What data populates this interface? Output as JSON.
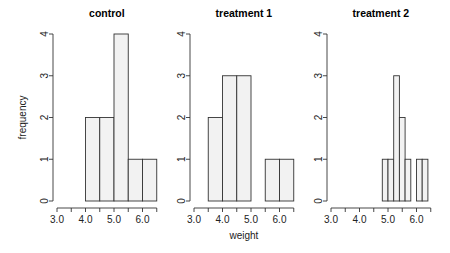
{
  "chart_data": [
    {
      "type": "bar",
      "subtype": "histogram",
      "title": "control",
      "xlabel": "",
      "ylabel": "frequency",
      "xlim": [
        3.0,
        6.5
      ],
      "ylim": [
        0,
        4
      ],
      "x_ticks": [
        3.0,
        3.5,
        4.0,
        4.5,
        5.0,
        5.5,
        6.0,
        6.5
      ],
      "x_tick_labels": [
        "3.0",
        "4.0",
        "5.0",
        "6.0"
      ],
      "x_tick_label_values": [
        3.0,
        4.0,
        5.0,
        6.0
      ],
      "y_ticks": [
        0,
        1,
        2,
        3,
        4
      ],
      "y_tick_labels": [
        "0",
        "1",
        "2",
        "3",
        "4"
      ],
      "bins": [
        {
          "from": 4.0,
          "to": 4.5,
          "count": 2
        },
        {
          "from": 4.5,
          "to": 5.0,
          "count": 2
        },
        {
          "from": 5.0,
          "to": 5.5,
          "count": 4
        },
        {
          "from": 5.5,
          "to": 6.0,
          "count": 1
        },
        {
          "from": 6.0,
          "to": 6.5,
          "count": 1
        }
      ]
    },
    {
      "type": "bar",
      "subtype": "histogram",
      "title": "treatment 1",
      "xlabel": "weight",
      "ylabel": "",
      "xlim": [
        3.0,
        6.5
      ],
      "ylim": [
        0,
        4
      ],
      "x_ticks": [
        3.0,
        3.5,
        4.0,
        4.5,
        5.0,
        5.5,
        6.0,
        6.5
      ],
      "x_tick_labels": [
        "3.0",
        "4.0",
        "5.0",
        "6.0"
      ],
      "x_tick_label_values": [
        3.0,
        4.0,
        5.0,
        6.0
      ],
      "y_ticks": [
        0,
        1,
        2,
        3,
        4
      ],
      "y_tick_labels": [
        "0",
        "1",
        "2",
        "3",
        "4"
      ],
      "bins": [
        {
          "from": 3.5,
          "to": 4.0,
          "count": 2
        },
        {
          "from": 4.0,
          "to": 4.5,
          "count": 3
        },
        {
          "from": 4.5,
          "to": 5.0,
          "count": 3
        },
        {
          "from": 5.0,
          "to": 5.5,
          "count": 0
        },
        {
          "from": 5.5,
          "to": 6.0,
          "count": 1
        },
        {
          "from": 6.0,
          "to": 6.5,
          "count": 1
        }
      ]
    },
    {
      "type": "bar",
      "subtype": "histogram",
      "title": "treatment 2",
      "xlabel": "",
      "ylabel": "",
      "xlim": [
        3.0,
        6.5
      ],
      "ylim": [
        0,
        4
      ],
      "x_ticks": [
        3.0,
        3.5,
        4.0,
        4.5,
        5.0,
        5.5,
        6.0,
        6.5
      ],
      "x_tick_labels": [
        "3.0",
        "4.0",
        "5.0",
        "6.0"
      ],
      "x_tick_label_values": [
        3.0,
        4.0,
        5.0,
        6.0
      ],
      "y_ticks": [
        0,
        1,
        2,
        3,
        4
      ],
      "y_tick_labels": [
        "0",
        "1",
        "2",
        "3",
        "4"
      ],
      "bins": [
        {
          "from": 4.8,
          "to": 5.0,
          "count": 1
        },
        {
          "from": 5.0,
          "to": 5.2,
          "count": 1
        },
        {
          "from": 5.2,
          "to": 5.4,
          "count": 3
        },
        {
          "from": 5.4,
          "to": 5.6,
          "count": 2
        },
        {
          "from": 5.6,
          "to": 5.8,
          "count": 1
        },
        {
          "from": 5.8,
          "to": 6.0,
          "count": 0
        },
        {
          "from": 6.0,
          "to": 6.2,
          "count": 1
        },
        {
          "from": 6.2,
          "to": 6.4,
          "count": 1
        }
      ]
    }
  ]
}
